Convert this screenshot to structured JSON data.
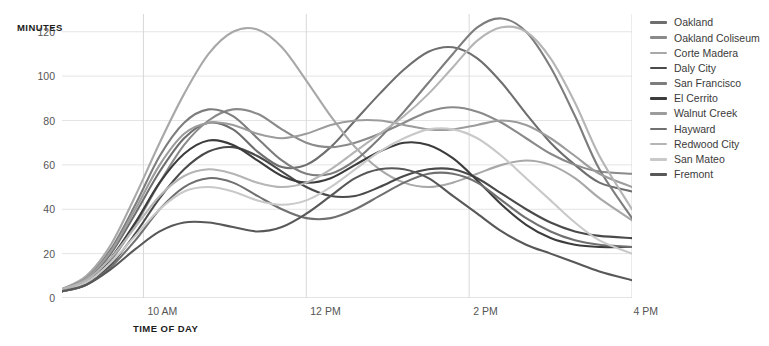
{
  "axes": {
    "y_title": "MINUTES",
    "x_title": "TIME OF DAY"
  },
  "chart_data": {
    "type": "line",
    "title": "",
    "xlabel": "TIME OF DAY",
    "ylabel": "MINUTES",
    "xlim": [
      9.0,
      16.0
    ],
    "ylim": [
      0,
      128
    ],
    "ytick_labels": [
      "0",
      "20",
      "40",
      "60",
      "80",
      "100",
      "120"
    ],
    "ytick_values": [
      0,
      20,
      40,
      60,
      80,
      100,
      120
    ],
    "xtick_labels": [
      "10 AM",
      "12 PM",
      "2 PM",
      "4 PM"
    ],
    "xtick_values": [
      10,
      12,
      14,
      16
    ],
    "grid": true,
    "legend_position": "right",
    "x": [
      9.0,
      9.3,
      9.6,
      9.9,
      10.2,
      10.5,
      10.8,
      11.1,
      11.4,
      11.7,
      12.0,
      12.3,
      12.6,
      12.9,
      13.2,
      13.5,
      13.8,
      14.1,
      14.4,
      14.7,
      15.0,
      15.3,
      15.6,
      16.0
    ],
    "series": [
      {
        "name": "Oakland",
        "color": "#6e6e6e",
        "values": [
          3,
          8,
          20,
          38,
          57,
          72,
          79,
          76,
          66,
          59,
          60,
          68,
          80,
          92,
          103,
          111,
          113,
          108,
          97,
          83,
          70,
          60,
          52,
          48
        ]
      },
      {
        "name": "Oakland Coliseum",
        "color": "#8a8a8a",
        "values": [
          3,
          7,
          17,
          33,
          52,
          69,
          80,
          85,
          83,
          76,
          70,
          68,
          70,
          74,
          79,
          84,
          86,
          84,
          79,
          72,
          65,
          60,
          57,
          56
        ]
      },
      {
        "name": "Corte Madera",
        "color": "#a8a8a8",
        "values": [
          4,
          10,
          24,
          46,
          70,
          92,
          110,
          120,
          121,
          113,
          98,
          82,
          68,
          58,
          52,
          50,
          52,
          56,
          60,
          62,
          60,
          54,
          45,
          35
        ]
      },
      {
        "name": "Daly City",
        "color": "#4a4a4a",
        "values": [
          3,
          6,
          15,
          29,
          45,
          58,
          66,
          68,
          64,
          57,
          50,
          46,
          46,
          50,
          55,
          58,
          58,
          54,
          47,
          40,
          34,
          30,
          28,
          27
        ]
      },
      {
        "name": "San Francisco",
        "color": "#7d7d7d",
        "values": [
          4,
          9,
          22,
          42,
          64,
          79,
          85,
          82,
          72,
          62,
          56,
          56,
          62,
          72,
          84,
          97,
          110,
          122,
          126,
          120,
          104,
          82,
          58,
          36
        ]
      },
      {
        "name": "El Cerrito",
        "color": "#3c3c3c",
        "values": [
          3,
          7,
          18,
          34,
          52,
          65,
          71,
          69,
          62,
          55,
          52,
          54,
          60,
          66,
          70,
          69,
          63,
          53,
          42,
          33,
          27,
          24,
          23,
          23
        ]
      },
      {
        "name": "Walnut Creek",
        "color": "#9c9c9c",
        "values": [
          4,
          9,
          21,
          40,
          60,
          74,
          79,
          78,
          74,
          72,
          74,
          78,
          80,
          80,
          78,
          76,
          76,
          78,
          80,
          78,
          72,
          64,
          56,
          50
        ]
      },
      {
        "name": "Hayward",
        "color": "#707070",
        "values": [
          3,
          6,
          14,
          26,
          40,
          50,
          54,
          52,
          46,
          40,
          36,
          36,
          40,
          46,
          52,
          56,
          56,
          52,
          44,
          36,
          30,
          26,
          24,
          23
        ]
      },
      {
        "name": "Redwood City",
        "color": "#b5b5b5",
        "values": [
          4,
          8,
          18,
          32,
          46,
          55,
          58,
          56,
          52,
          50,
          52,
          58,
          66,
          74,
          82,
          92,
          104,
          116,
          122,
          120,
          108,
          88,
          64,
          40
        ]
      },
      {
        "name": "San Mateo",
        "color": "#c9c9c9",
        "values": [
          3,
          7,
          16,
          28,
          40,
          48,
          50,
          48,
          44,
          42,
          44,
          50,
          58,
          66,
          72,
          76,
          76,
          72,
          64,
          54,
          44,
          34,
          26,
          20
        ]
      },
      {
        "name": "Fremont",
        "color": "#585858",
        "values": [
          3,
          6,
          13,
          22,
          30,
          34,
          34,
          32,
          30,
          32,
          38,
          46,
          54,
          58,
          58,
          54,
          46,
          38,
          30,
          24,
          20,
          16,
          12,
          8
        ]
      }
    ]
  }
}
